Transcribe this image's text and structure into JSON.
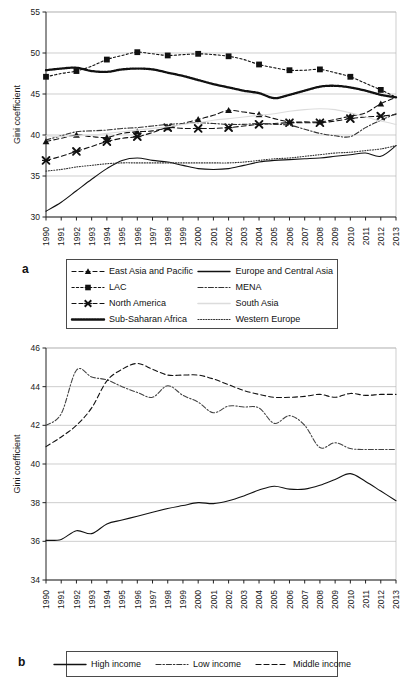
{
  "figure": {
    "panel_a_letter": "a",
    "panel_b_letter": "b"
  },
  "chart_data": [
    {
      "id": "panel_a",
      "type": "line",
      "title": "",
      "xlabel": "",
      "ylabel": "Gini coefficient",
      "xlim": [
        1990,
        2013
      ],
      "ylim": [
        30,
        55
      ],
      "yticks": [
        30,
        35,
        40,
        45,
        50,
        55
      ],
      "grid": "horizontal",
      "legend_position": "below",
      "x": [
        1990,
        1991,
        1992,
        1993,
        1994,
        1995,
        1996,
        1997,
        1998,
        1999,
        2000,
        2001,
        2002,
        2003,
        2004,
        2005,
        2006,
        2007,
        2008,
        2009,
        2010,
        2011,
        2012,
        2013
      ],
      "series": [
        {
          "name": "East Asia and Pacific",
          "style": "dashed",
          "marker": "triangle",
          "color": "#111111",
          "values": [
            39.2,
            39.6,
            40.0,
            39.8,
            39.7,
            40.2,
            40.4,
            40.5,
            40.9,
            41.4,
            41.9,
            42.4,
            43.0,
            42.8,
            42.5,
            42.0,
            41.6,
            41.6,
            41.6,
            41.9,
            42.3,
            42.7,
            43.8,
            44.6
          ]
        },
        {
          "name": "LAC",
          "style": "dotted",
          "marker": "square",
          "color": "#111111",
          "values": [
            47.1,
            47.5,
            47.8,
            48.4,
            49.2,
            49.7,
            50.1,
            49.9,
            49.7,
            49.8,
            49.9,
            49.8,
            49.6,
            49.2,
            48.6,
            48.2,
            47.9,
            47.9,
            48.0,
            47.6,
            47.1,
            46.3,
            45.5,
            44.6
          ]
        },
        {
          "name": "North America",
          "style": "dashed",
          "marker": "x-cross",
          "color": "#111111",
          "values": [
            36.9,
            37.4,
            38.0,
            38.6,
            39.2,
            39.6,
            39.8,
            40.3,
            40.9,
            40.8,
            40.8,
            40.8,
            40.9,
            41.1,
            41.3,
            41.4,
            41.5,
            41.5,
            41.5,
            41.7,
            42.0,
            42.2,
            42.3,
            42.5
          ]
        },
        {
          "name": "Sub-Saharan Africa",
          "style": "thick-dotted",
          "marker": "none",
          "color": "#111111",
          "values": [
            47.9,
            48.1,
            48.2,
            47.8,
            47.7,
            48.0,
            48.1,
            48.0,
            47.6,
            47.2,
            46.7,
            46.2,
            45.8,
            45.4,
            45.1,
            44.5,
            44.9,
            45.4,
            45.9,
            46.0,
            45.8,
            45.4,
            44.9,
            44.6
          ]
        },
        {
          "name": "Europe and Central Asia",
          "style": "solid",
          "marker": "none",
          "color": "#111111",
          "values": [
            30.7,
            31.8,
            33.2,
            34.6,
            35.9,
            36.9,
            37.2,
            36.9,
            36.7,
            36.3,
            35.9,
            35.8,
            35.9,
            36.3,
            36.7,
            36.9,
            37.0,
            37.1,
            37.2,
            37.4,
            37.6,
            37.8,
            37.4,
            38.7
          ]
        },
        {
          "name": "MENA",
          "style": "dash-dot",
          "marker": "none",
          "color": "#333333",
          "values": [
            39.4,
            39.9,
            40.4,
            40.5,
            40.6,
            40.8,
            40.9,
            41.1,
            41.3,
            41.4,
            41.5,
            41.4,
            41.3,
            41.3,
            41.4,
            41.3,
            41.2,
            40.7,
            40.2,
            39.9,
            39.8,
            40.9,
            41.8,
            42.6
          ]
        },
        {
          "name": "South Asia",
          "style": "solid",
          "marker": "none",
          "color": "#dcdcdc",
          "values": [
            39.9,
            39.8,
            39.9,
            40.0,
            40.2,
            40.4,
            40.6,
            40.8,
            41.0,
            41.3,
            41.5,
            41.8,
            42.0,
            42.2,
            42.4,
            42.6,
            42.9,
            43.1,
            43.2,
            43.1,
            42.7,
            42.2,
            41.7,
            41.3
          ]
        },
        {
          "name": "Western Europe",
          "style": "fine-dotted",
          "marker": "none",
          "color": "#333333",
          "values": [
            35.6,
            35.8,
            36.1,
            36.3,
            36.5,
            36.6,
            36.6,
            36.6,
            36.6,
            36.6,
            36.6,
            36.6,
            36.6,
            36.7,
            36.9,
            37.1,
            37.2,
            37.4,
            37.6,
            37.8,
            37.9,
            38.1,
            38.3,
            38.7
          ]
        }
      ]
    },
    {
      "id": "panel_b",
      "type": "line",
      "title": "",
      "xlabel": "",
      "ylabel": "Gini coefficient",
      "xlim": [
        1990,
        2013
      ],
      "ylim": [
        34,
        46
      ],
      "yticks": [
        34,
        36,
        38,
        40,
        42,
        44,
        46
      ],
      "grid": "horizontal",
      "legend_position": "below",
      "x": [
        1990,
        1991,
        1992,
        1993,
        1994,
        1995,
        1996,
        1997,
        1998,
        1999,
        2000,
        2001,
        2002,
        2003,
        2004,
        2005,
        2006,
        2007,
        2008,
        2009,
        2010,
        2011,
        2012,
        2013
      ],
      "series": [
        {
          "name": "High income",
          "style": "solid",
          "marker": "none",
          "color": "#111111",
          "values": [
            36.05,
            36.1,
            36.55,
            36.4,
            36.9,
            37.1,
            37.3,
            37.5,
            37.7,
            37.85,
            38.0,
            37.95,
            38.1,
            38.35,
            38.65,
            38.85,
            38.7,
            38.7,
            38.9,
            39.2,
            39.5,
            39.1,
            38.6,
            38.1
          ]
        },
        {
          "name": "Low income",
          "style": "dash-dot",
          "marker": "none",
          "color": "#444444",
          "values": [
            42.0,
            42.6,
            44.85,
            44.5,
            44.35,
            44.0,
            43.7,
            43.45,
            44.05,
            43.55,
            43.2,
            42.65,
            43.0,
            42.95,
            42.9,
            42.1,
            42.5,
            42.0,
            40.85,
            41.1,
            40.8,
            40.75,
            40.75,
            40.75
          ]
        },
        {
          "name": "Middle income",
          "style": "dashed",
          "marker": "none",
          "color": "#111111",
          "values": [
            40.9,
            41.4,
            42.0,
            42.9,
            44.3,
            44.9,
            45.2,
            44.9,
            44.6,
            44.6,
            44.6,
            44.4,
            44.1,
            43.8,
            43.6,
            43.45,
            43.45,
            43.5,
            43.6,
            43.45,
            43.65,
            43.55,
            43.6,
            43.6
          ]
        }
      ]
    }
  ],
  "panel_a": {
    "ylabel": "Gini coefficient",
    "yticks": [
      "30",
      "35",
      "40",
      "45",
      "50",
      "55"
    ],
    "xticks": [
      "1990",
      "1991",
      "1992",
      "1993",
      "1994",
      "1995",
      "1996",
      "1997",
      "1998",
      "1999",
      "2000",
      "2001",
      "2002",
      "2003",
      "2004",
      "2005",
      "2006",
      "2007",
      "2008",
      "2009",
      "2010",
      "2011",
      "2012",
      "2013"
    ],
    "legend": [
      {
        "label": "East Asia and Pacific",
        "swatch": "dashed-triangle"
      },
      {
        "label": "Europe and Central Asia",
        "swatch": "solid"
      },
      {
        "label": "LAC",
        "swatch": "dotted-square"
      },
      {
        "label": "MENA",
        "swatch": "dash-dot"
      },
      {
        "label": "North America",
        "swatch": "dashed-x"
      },
      {
        "label": "South Asia",
        "swatch": "solid-light"
      },
      {
        "label": "Sub-Saharan Africa",
        "swatch": "thick-dotted"
      },
      {
        "label": "Western Europe",
        "swatch": "fine-dotted"
      }
    ]
  },
  "panel_b": {
    "ylabel": "Gini coefficient",
    "yticks": [
      "34",
      "36",
      "38",
      "40",
      "42",
      "44",
      "46"
    ],
    "xticks": [
      "1990",
      "1991",
      "1992",
      "1993",
      "1994",
      "1995",
      "1996",
      "1997",
      "1998",
      "1999",
      "2000",
      "2001",
      "2002",
      "2003",
      "2004",
      "2005",
      "2006",
      "2007",
      "2008",
      "2009",
      "2010",
      "2011",
      "2012",
      "2013"
    ],
    "legend": [
      {
        "label": "High income",
        "swatch": "solid"
      },
      {
        "label": "Low income",
        "swatch": "dash-dot"
      },
      {
        "label": "Middle income",
        "swatch": "dashed"
      }
    ]
  }
}
